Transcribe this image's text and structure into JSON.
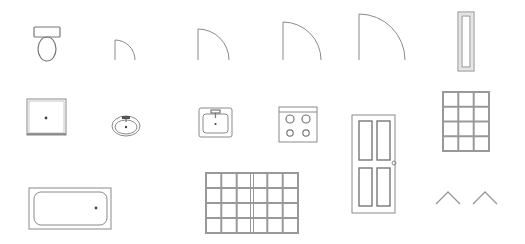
{
  "stroke_color": "#8a8a8a",
  "background": "#ffffff",
  "symbols": [
    {
      "name": "toilet",
      "label": "Toilet",
      "row": 1
    },
    {
      "name": "door-swing-small",
      "label": "Door swing (small)",
      "row": 1
    },
    {
      "name": "door-swing-medium",
      "label": "Door swing (medium)",
      "row": 1
    },
    {
      "name": "door-swing-large",
      "label": "Door swing (large)",
      "row": 1
    },
    {
      "name": "door-swing-xlarge",
      "label": "Door swing (extra large)",
      "row": 1
    },
    {
      "name": "narrow-window",
      "label": "Narrow window",
      "row": 1
    },
    {
      "name": "shower",
      "label": "Shower",
      "row": 2
    },
    {
      "name": "oval-sink",
      "label": "Oval sink",
      "row": 2
    },
    {
      "name": "square-sink",
      "label": "Square sink",
      "row": 2
    },
    {
      "name": "cooktop",
      "label": "Cooktop (4 burners)",
      "row": 2
    },
    {
      "name": "panel-door",
      "label": "Panel door",
      "row": 2
    },
    {
      "name": "window-3x4",
      "label": "Window 3x4 panes",
      "row": 2
    },
    {
      "name": "bathtub",
      "label": "Bathtub",
      "row": 3
    },
    {
      "name": "window-6x4",
      "label": "Double window 6x4 panes",
      "row": 3
    },
    {
      "name": "roof-vents",
      "label": "Roof pitch markers",
      "row": 3
    }
  ]
}
